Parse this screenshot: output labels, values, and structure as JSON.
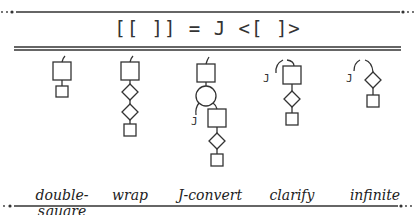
{
  "title": "[[ ]] = J <[ ]>",
  "stroke_color": "#333333",
  "diagrams": [
    {
      "label": "double-square",
      "cx": 62
    },
    {
      "label": "wrap",
      "cx": 130
    },
    {
      "label": "J-convert",
      "cx": 210
    },
    {
      "label": "clarify",
      "cx": 292
    },
    {
      "label": "infinite",
      "cx": 375
    }
  ],
  "j_glyph": "J"
}
